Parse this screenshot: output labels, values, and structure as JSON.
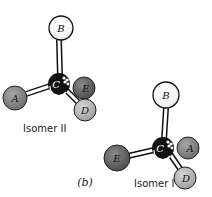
{
  "figure": {
    "caption": "(b)",
    "colors": {
      "atom_white": "#ffffff",
      "atom_light_gray": "#bdbdbd",
      "atom_mid_gray": "#9a9a9a",
      "atom_dark_gray": "#6e6e6e",
      "carbon": "#111111",
      "bond": "#ffffff",
      "outline": "#111111"
    },
    "isomer_ii": {
      "label": "Isomer II",
      "atoms": {
        "B": "B",
        "C": "C",
        "E": "E",
        "A": "A",
        "D": "D"
      }
    },
    "isomer_i": {
      "label": "Isomer I",
      "atoms": {
        "B": "B",
        "C": "C",
        "A": "A",
        "E": "E",
        "D": "D"
      }
    }
  }
}
